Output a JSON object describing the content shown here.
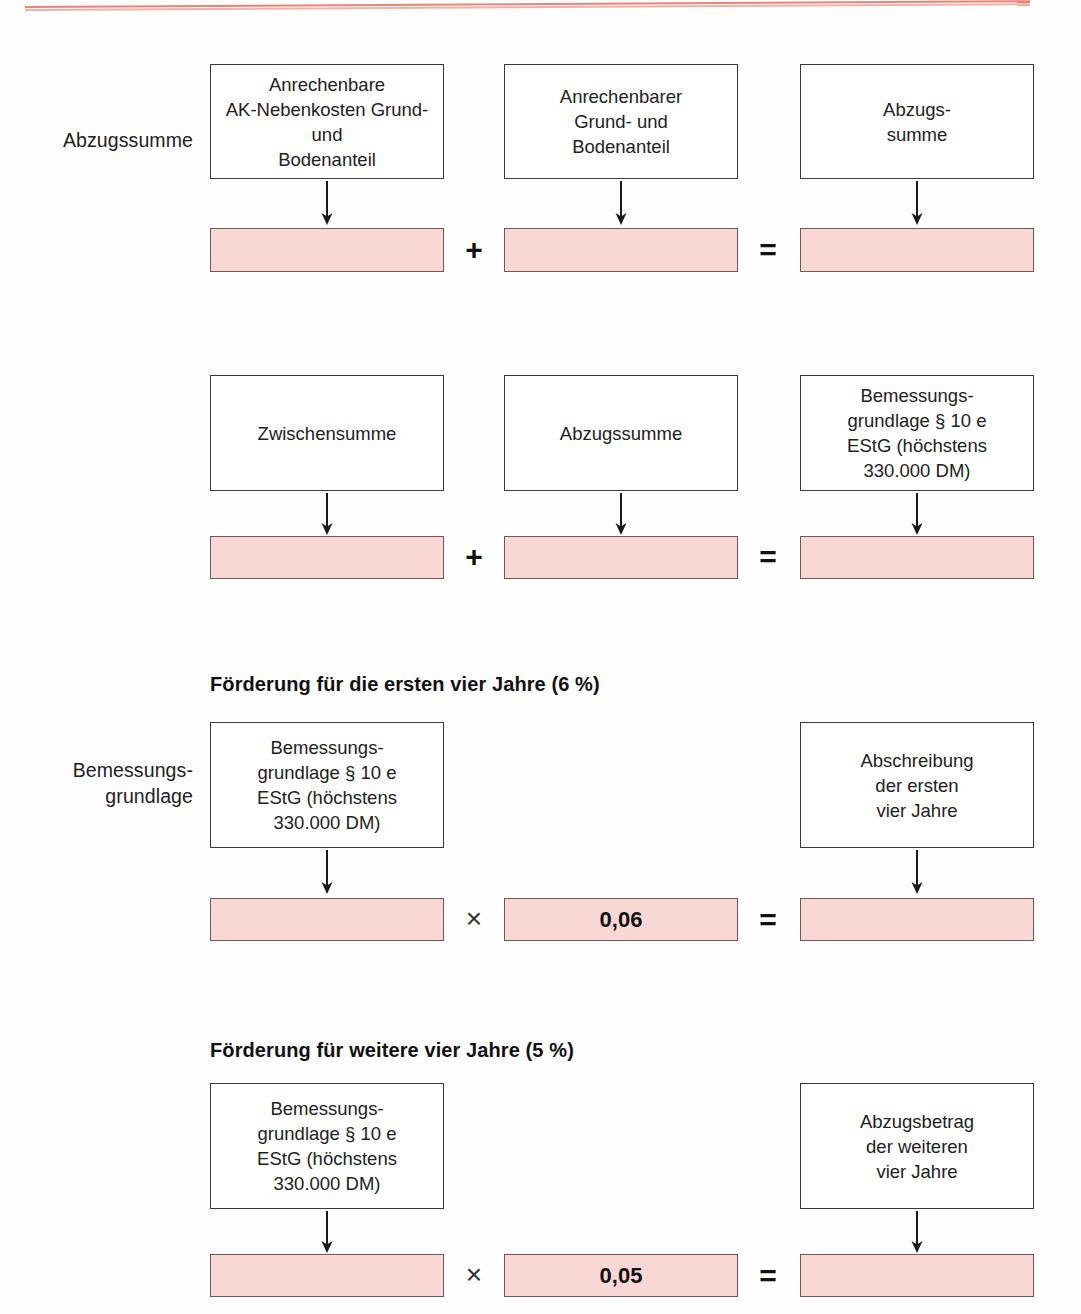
{
  "page": {
    "background_color": "#ffffff",
    "rule_color": "#e8786a",
    "box_border_color": "#3a3a3a",
    "value_bar_fill": "#f8d7d5",
    "value_bar_border": "#6d5a58"
  },
  "sections": [
    {
      "id": "abzugssumme",
      "side_label": "Abzugssumme",
      "heading": "",
      "boxes": [
        {
          "label": "Anrechenbare\nAK-Nebenkosten Grund-\nund\nBodenanteil"
        },
        {
          "label": "Anrechenbarer\nGrund- und\nBodenanteil"
        },
        {
          "label": "Abzugs-\nsumme"
        }
      ],
      "bars": [
        {
          "value": ""
        },
        {
          "value": ""
        },
        {
          "value": ""
        }
      ],
      "operators": [
        {
          "symbol": "+",
          "name": "plus"
        },
        {
          "symbol": "=",
          "name": "equals"
        }
      ]
    },
    {
      "id": "bemessungsgrundlage-summe",
      "side_label": "",
      "heading": "",
      "boxes": [
        {
          "label": "Zwischensumme"
        },
        {
          "label": "Abzugssumme"
        },
        {
          "label": "Bemessungs-\ngrundlage § 10 e\nEStG (höchstens\n330.000 DM)"
        }
      ],
      "bars": [
        {
          "value": ""
        },
        {
          "value": ""
        },
        {
          "value": ""
        }
      ],
      "operators": [
        {
          "symbol": "+",
          "name": "plus"
        },
        {
          "symbol": "=",
          "name": "equals"
        }
      ]
    },
    {
      "id": "foerderung-erste-vier-jahre",
      "side_label": "Bemessungs-\ngrundlage",
      "heading": "Förderung für die ersten vier Jahre (6 %)",
      "boxes": [
        {
          "label": "Bemessungs-\ngrundlage § 10 e\nEStG (höchstens\n330.000 DM)"
        },
        {
          "label": ""
        },
        {
          "label": "Abschreibung\nder ersten\nvier Jahre"
        }
      ],
      "bars": [
        {
          "value": ""
        },
        {
          "value": "0,06"
        },
        {
          "value": ""
        }
      ],
      "operators": [
        {
          "symbol": "×",
          "name": "times"
        },
        {
          "symbol": "=",
          "name": "equals"
        }
      ]
    },
    {
      "id": "foerderung-weitere-vier-jahre",
      "side_label": "",
      "heading": "Förderung für weitere vier Jahre (5 %)",
      "boxes": [
        {
          "label": "Bemessungs-\ngrundlage § 10 e\nEStG (höchstens\n330.000 DM)"
        },
        {
          "label": ""
        },
        {
          "label": "Abzugsbetrag\nder weiteren\nvier Jahre"
        }
      ],
      "bars": [
        {
          "value": ""
        },
        {
          "value": "0,05"
        },
        {
          "value": ""
        }
      ],
      "operators": [
        {
          "symbol": "×",
          "name": "times"
        },
        {
          "symbol": "=",
          "name": "equals"
        }
      ]
    }
  ]
}
